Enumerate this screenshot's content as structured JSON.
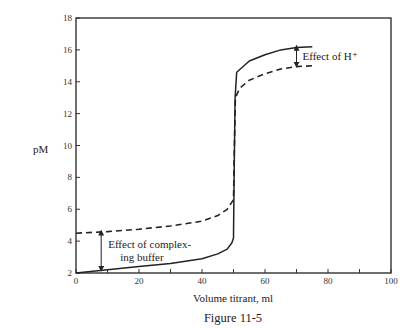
{
  "chart_data": {
    "type": "line",
    "title": "",
    "caption": "Figure 11-5",
    "xlabel": "Volume titrant, ml",
    "ylabel": "pM",
    "xlim": [
      0,
      100
    ],
    "ylim": [
      2,
      18
    ],
    "xticks": [
      0,
      20,
      40,
      60,
      80,
      100
    ],
    "xminor_ticks": [
      10,
      30,
      50,
      70,
      90
    ],
    "yticks": [
      2,
      4,
      6,
      8,
      10,
      12,
      14,
      16,
      18
    ],
    "grid": false,
    "legend": null,
    "series": [
      {
        "name": "Without complexing buffer",
        "style": "solid",
        "points": [
          [
            0,
            2.0
          ],
          [
            10,
            2.2
          ],
          [
            20,
            2.4
          ],
          [
            30,
            2.6
          ],
          [
            40,
            2.9
          ],
          [
            45,
            3.2
          ],
          [
            48,
            3.5
          ],
          [
            49.5,
            3.9
          ],
          [
            50,
            4.2
          ],
          [
            50.2,
            8.0
          ],
          [
            50.5,
            13.0
          ],
          [
            51,
            14.6
          ],
          [
            55,
            15.3
          ],
          [
            60,
            15.7
          ],
          [
            65,
            16.0
          ],
          [
            70,
            16.15
          ],
          [
            75,
            16.2
          ]
        ]
      },
      {
        "name": "With complexing buffer",
        "style": "dashed",
        "points": [
          [
            0,
            4.5
          ],
          [
            10,
            4.6
          ],
          [
            20,
            4.75
          ],
          [
            30,
            4.95
          ],
          [
            40,
            5.25
          ],
          [
            45,
            5.6
          ],
          [
            48,
            6.0
          ],
          [
            50,
            6.6
          ],
          [
            50.3,
            10.0
          ],
          [
            50.6,
            13.0
          ],
          [
            52,
            13.6
          ],
          [
            55,
            14.1
          ],
          [
            60,
            14.5
          ],
          [
            65,
            14.8
          ],
          [
            70,
            14.95
          ],
          [
            75,
            15.0
          ]
        ]
      }
    ],
    "annotations": [
      {
        "text_lines": [
          "Effect of H⁺"
        ],
        "arrow_x": 70,
        "arrow_y": [
          15.0,
          16.2
        ]
      },
      {
        "text_lines": [
          "Effect of complex-",
          "ing buffer"
        ],
        "arrow_x": 8,
        "arrow_y": [
          2.2,
          4.6
        ]
      }
    ]
  }
}
